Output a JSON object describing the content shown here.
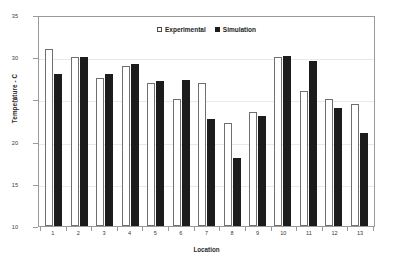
{
  "chart_data": {
    "type": "bar",
    "title": "",
    "xlabel": "Location",
    "ylabel": "Temperature - C",
    "categories": [
      "1",
      "2",
      "3",
      "4",
      "5",
      "6",
      "7",
      "8",
      "9",
      "10",
      "11",
      "12",
      "13"
    ],
    "ylim": [
      10,
      35
    ],
    "yticks": [
      10,
      15,
      20,
      25,
      30,
      35
    ],
    "grid": true,
    "legend_position": "top-center",
    "series": [
      {
        "name": "Experimental",
        "style": "open-square",
        "color": "#ffffff",
        "edge_color": "#6f6f6f",
        "values": [
          31,
          30,
          27.5,
          29,
          27,
          25,
          27,
          22.2,
          23.5,
          30,
          26,
          25,
          24.5
        ]
      },
      {
        "name": "Simulation",
        "style": "filled-square",
        "color": "#1c1c1c",
        "edge_color": "#1c1c1c",
        "values": [
          28,
          30,
          28,
          29.2,
          27.2,
          27.3,
          22.7,
          18,
          23,
          30.1,
          29.5,
          24,
          21
        ]
      }
    ]
  },
  "legend": {
    "items": [
      {
        "label": "Experimental"
      },
      {
        "label": "Simulation"
      }
    ]
  },
  "axes": {
    "x_title": "Location",
    "y_title": "Temperature - C"
  }
}
